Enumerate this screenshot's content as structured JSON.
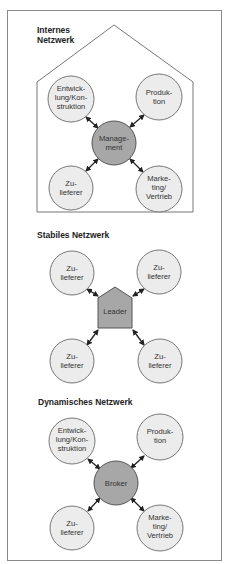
{
  "colors": {
    "node_fill": "#ececec",
    "hub_fill": "#a7a7a7",
    "frame": "#888888",
    "arrow": "#222222"
  },
  "sections": {
    "internal": {
      "title_line1": "Internes",
      "title_line2": "Netzwerk",
      "hub": {
        "line1": "Manage-",
        "line2": "ment"
      },
      "nodes": [
        {
          "line1": "Entwick-",
          "line2": "lung/Kon-",
          "line3": "struktion"
        },
        {
          "line1": "Produk-",
          "line2": "tion"
        },
        {
          "line1": "Zu-",
          "line2": "lieferer"
        },
        {
          "line1": "Marke-",
          "line2": "ting/",
          "line3": "Vertrieb"
        }
      ]
    },
    "stable": {
      "title": "Stabiles Netzwerk",
      "hub": {
        "line1": "Leader"
      },
      "nodes": [
        {
          "line1": "Zu-",
          "line2": "lieferer"
        },
        {
          "line1": "Zu-",
          "line2": "lieferer"
        },
        {
          "line1": "Zu-",
          "line2": "lieferer"
        },
        {
          "line1": "Zu-",
          "line2": "lieferer"
        }
      ]
    },
    "dynamic": {
      "title": "Dynamisches Netzwerk",
      "hub": {
        "line1": "Broker"
      },
      "nodes": [
        {
          "line1": "Entwick-",
          "line2": "lung/Kon-",
          "line3": "struktion"
        },
        {
          "line1": "Produk-",
          "line2": "tion"
        },
        {
          "line1": "Zu-",
          "line2": "lieferer"
        },
        {
          "line1": "Marke-",
          "line2": "ting/",
          "line3": "Vertrieb"
        }
      ]
    }
  }
}
